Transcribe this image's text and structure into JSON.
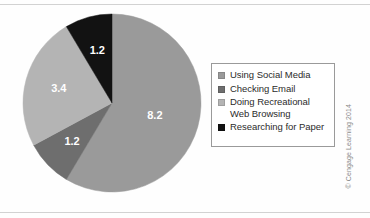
{
  "chart_data": {
    "type": "pie",
    "title": "",
    "subtitle": "",
    "xlabel": "",
    "ylabel": "",
    "categories": [
      "Using Social Media",
      "Checking Email",
      "Doing Recreational Web Browsing",
      "Researching for Paper"
    ],
    "values": [
      8.2,
      1.2,
      3.4,
      1.2
    ],
    "data_labels": [
      "8.2",
      "1.2",
      "3.4",
      "1.2"
    ],
    "total": 14.0,
    "colors": [
      "#9a9a9a",
      "#6e6e6e",
      "#b4b4b4",
      "#121212"
    ],
    "start_angle_deg": 0,
    "direction": "clockwise",
    "legend_position": "right",
    "grid": false,
    "slices": [
      {
        "label": "Using Social Media",
        "value": 8.2,
        "data_label": "8.2",
        "color": "#9a9a9a",
        "start_deg": 0.0,
        "sweep_deg": 210.857,
        "label_color": "#1a1a1a"
      },
      {
        "label": "Checking Email",
        "value": 1.2,
        "data_label": "1.2",
        "color": "#6e6e6e",
        "start_deg": 210.857,
        "sweep_deg": 30.857,
        "label_color": "#ffffff"
      },
      {
        "label": "Doing Recreational Web Browsing",
        "value": 3.4,
        "data_label": "3.4",
        "color": "#b4b4b4",
        "start_deg": 241.714,
        "sweep_deg": 87.429,
        "label_color": "#ffffff"
      },
      {
        "label": "Researching for Paper",
        "value": 1.2,
        "data_label": "1.2",
        "color": "#121212",
        "start_deg": 329.143,
        "sweep_deg": 30.857,
        "label_color": "#ffffff"
      }
    ]
  },
  "legend": {
    "items": [
      {
        "label": "Using Social Media",
        "color": "#9a9a9a"
      },
      {
        "label": "Checking Email",
        "color": "#6e6e6e"
      },
      {
        "label": "Doing Recreational\nWeb Browsing",
        "color": "#b4b4b4"
      },
      {
        "label": "Researching for Paper",
        "color": "#121212"
      }
    ]
  },
  "credit": {
    "text": "© Cengage Learning 2014"
  },
  "geometry": {
    "center_x": 90,
    "center_y": 90,
    "radius": 89
  }
}
